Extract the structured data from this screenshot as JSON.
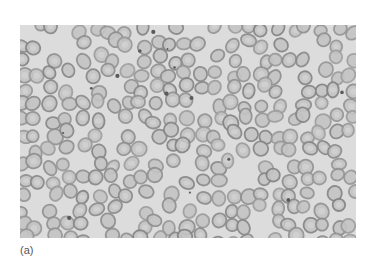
{
  "figure": {
    "caption_label": "(a)",
    "colors": {
      "background": "#dcdcdc",
      "cell_rim": "#8c8c8c",
      "cell_center": "#c4c4c4",
      "platelet": "#5a5a5a"
    }
  }
}
